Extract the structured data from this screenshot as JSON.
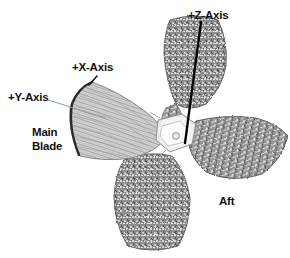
{
  "figure": {
    "background_color": "#ffffff",
    "ink_color": "#111111",
    "leader_color_faint": "#9a9a9a"
  },
  "labels": {
    "y_axis": "+Y-Axis",
    "x_axis": "+X-Axis",
    "z_axis": "+Z-Axis",
    "aft": "Aft",
    "main": "Main",
    "blade": "Blade"
  },
  "annotations": [
    {
      "name": "y-axis-leader",
      "from": [
        48,
        100
      ],
      "to": [
        106,
        118
      ],
      "style": "thin-gray"
    },
    {
      "name": "x-axis-leader",
      "from": [
        97,
        76
      ],
      "to": [
        89,
        85
      ],
      "style": "thin-dark"
    },
    {
      "name": "z-axis-line",
      "from": [
        201,
        22
      ],
      "to": [
        185,
        143
      ],
      "style": "thick-black"
    }
  ],
  "blades": [
    {
      "name": "main-blade",
      "position": "left",
      "tone": "light"
    },
    {
      "name": "upper-blade",
      "position": "upper-right",
      "tone": "dark"
    },
    {
      "name": "right-blade",
      "position": "right",
      "tone": "dark"
    },
    {
      "name": "bottom-blade",
      "position": "bottom",
      "tone": "dark"
    }
  ],
  "hub": {
    "name": "center-hub",
    "tone": "white"
  }
}
